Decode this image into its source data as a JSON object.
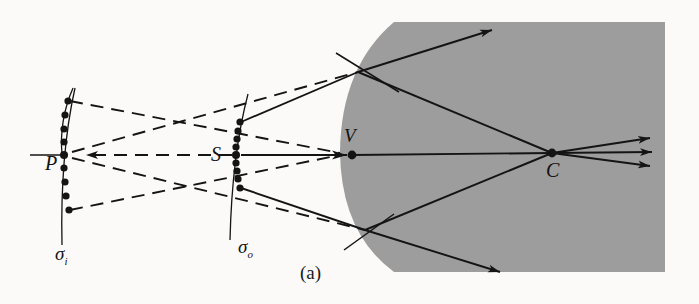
{
  "figure": {
    "caption": "(a)",
    "background_color": "#fbfaf8",
    "medium_color": "#9d9d9d",
    "ink_color": "#141414",
    "labels": {
      "image_point": "P",
      "object_point": "S",
      "vertex": "V",
      "center_of_curvature": "C",
      "image_wavefront": "σ",
      "image_wavefront_sub": "i",
      "object_wavefront": "σ",
      "object_wavefront_sub": "o"
    },
    "geometry": {
      "image_point_xy": [
        66,
        155
      ],
      "object_point_xy": [
        237,
        155
      ],
      "vertex_xy": [
        352,
        155
      ],
      "center_xy": [
        552,
        153
      ],
      "upper_reflection_xy": [
        358,
        72
      ],
      "lower_reflection_xy": [
        365,
        230
      ],
      "medium_rect": [
        394,
        22,
        665,
        272
      ],
      "sigma_i_dot_count": 9,
      "sigma_o_dot_count": 9
    },
    "line_styles": {
      "virtual_rays": "dashed",
      "real_rays": "solid"
    }
  }
}
